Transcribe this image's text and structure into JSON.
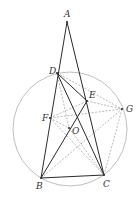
{
  "diagram": {
    "type": "geometry",
    "circle": {
      "center": "O",
      "cx": 70,
      "cy": 129,
      "r": 57
    },
    "points": {
      "A": {
        "x": 67,
        "y": 22,
        "label": "A",
        "lx": 64,
        "ly": 17
      },
      "D": {
        "x": 57,
        "y": 73,
        "label": "D",
        "lx": 49,
        "ly": 74
      },
      "E": {
        "x": 87,
        "y": 101,
        "label": "E",
        "lx": 89,
        "ly": 98
      },
      "G": {
        "x": 122,
        "y": 109,
        "label": "G",
        "lx": 126,
        "ly": 112
      },
      "F": {
        "x": 50,
        "y": 118,
        "label": "F",
        "lx": 42,
        "ly": 121
      },
      "O": {
        "x": 69,
        "y": 128,
        "label": "O",
        "lx": 72,
        "ly": 134
      },
      "B": {
        "x": 41,
        "y": 178,
        "label": "B",
        "lx": 36,
        "ly": 189
      },
      "C": {
        "x": 104,
        "y": 175,
        "label": "C",
        "lx": 103,
        "ly": 187
      }
    },
    "solid_segments": [
      [
        "A",
        "B"
      ],
      [
        "A",
        "C"
      ],
      [
        "B",
        "C"
      ],
      [
        "D",
        "C"
      ],
      [
        "D",
        "E"
      ],
      [
        "B",
        "E"
      ]
    ],
    "dashed_segments": [
      [
        "D",
        "G"
      ],
      [
        "D",
        "O"
      ],
      [
        "F",
        "G"
      ],
      [
        "F",
        "E"
      ],
      [
        "F",
        "C"
      ],
      [
        "G",
        "C"
      ],
      [
        "B",
        "G"
      ],
      [
        "O",
        "C"
      ],
      [
        "E",
        "G"
      ],
      [
        "F",
        "O"
      ]
    ]
  }
}
